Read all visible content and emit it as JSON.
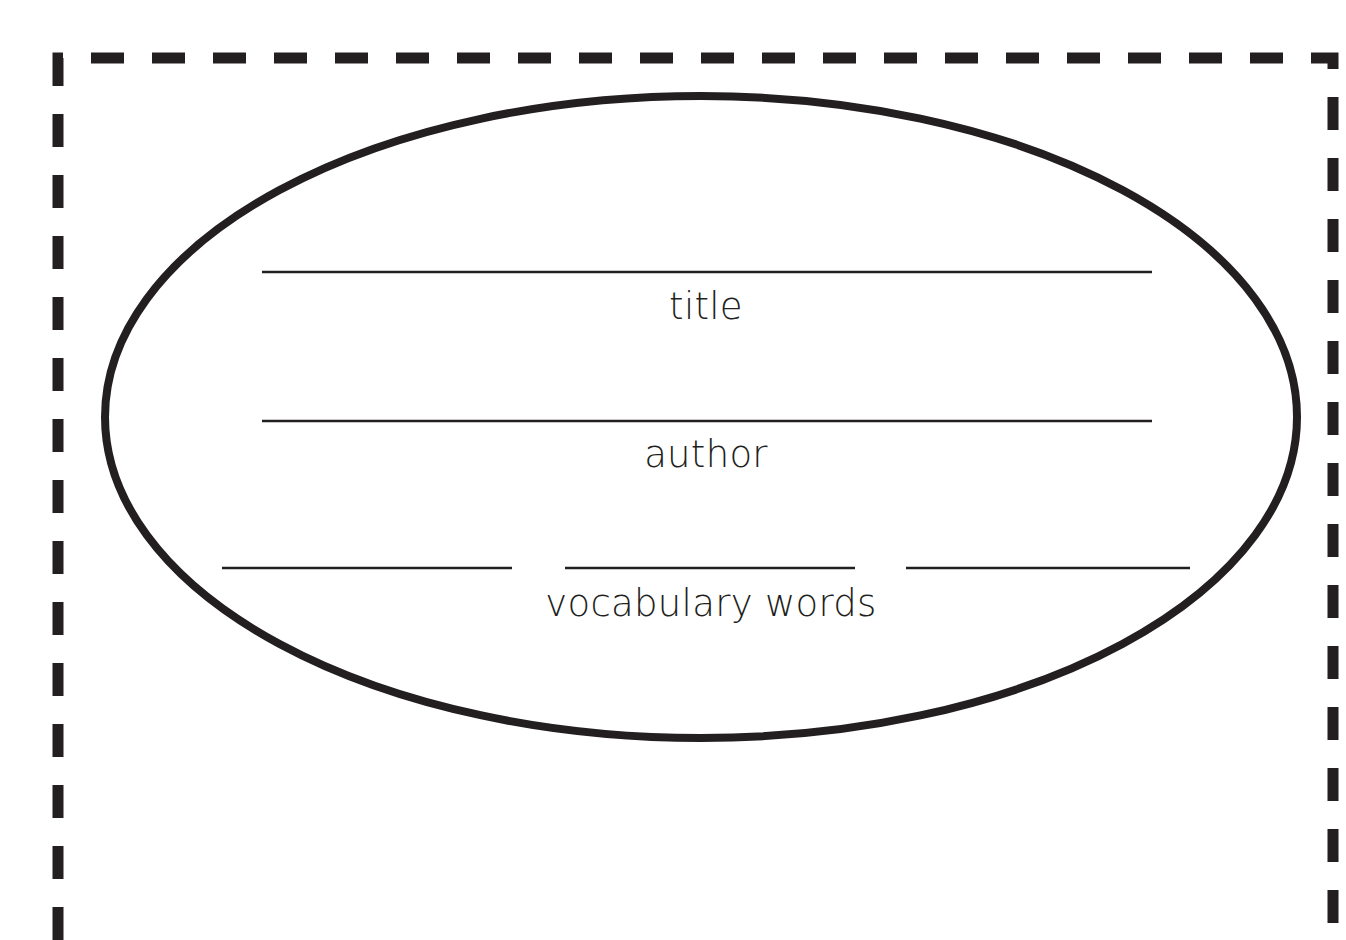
{
  "document": {
    "kind": "book-report-graphic-organizer",
    "shape": "ellipse",
    "border_style": "dashed",
    "colors": {
      "ink": "#231f20",
      "paper": "#ffffff",
      "rule_line": "#231f20",
      "border": "#231f20"
    }
  },
  "fields": [
    {
      "id": "title",
      "label": "title",
      "value": "",
      "placeholder": "",
      "lines": 1
    },
    {
      "id": "author",
      "label": "author",
      "value": "",
      "placeholder": "",
      "lines": 1
    },
    {
      "id": "vocabulary",
      "label": "vocabulary words",
      "value": "",
      "placeholder": "",
      "lines": 3
    }
  ],
  "write_in_lines": {
    "title": [
      ""
    ],
    "author": [
      ""
    ],
    "vocabulary": [
      "",
      "",
      ""
    ]
  }
}
